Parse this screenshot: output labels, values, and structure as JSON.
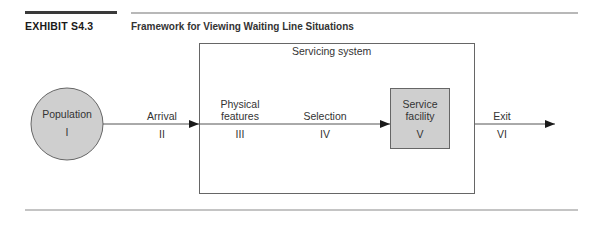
{
  "header": {
    "exhibit_label": "EXHIBIT S4.3",
    "title": "Framework for Viewing Waiting Line Situations"
  },
  "diagram": {
    "container_label": "Servicing system",
    "nodes": [
      {
        "id": "population",
        "label": "Population",
        "numeral": "I",
        "shape": "circle",
        "fill": "#cfcfcf"
      },
      {
        "id": "service-facility",
        "label_line1": "Service",
        "label_line2": "facility",
        "numeral": "V",
        "shape": "rect",
        "fill": "#cfcfcf"
      }
    ],
    "stages": [
      {
        "id": "arrival",
        "label": "Arrival",
        "numeral": "II"
      },
      {
        "id": "physical-features",
        "label_line1": "Physical",
        "label_line2": "features",
        "numeral": "III"
      },
      {
        "id": "selection",
        "label": "Selection",
        "numeral": "IV"
      },
      {
        "id": "exit",
        "label": "Exit",
        "numeral": "VI"
      }
    ],
    "colors": {
      "line": "#555555",
      "arrowhead": "#1a1a1a",
      "node_fill": "#cfcfcf",
      "border": "#666666"
    }
  }
}
